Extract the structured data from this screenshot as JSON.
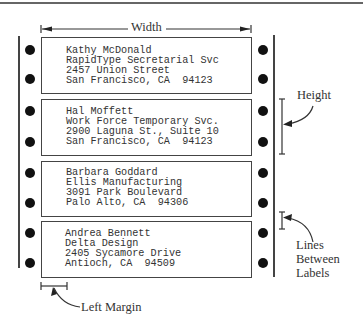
{
  "diagram": {
    "dimension_labels": {
      "width": "Width",
      "height": "Height",
      "lines_between_labels": [
        "Lines",
        "Between",
        "Labels"
      ],
      "left_margin": "Left Margin"
    },
    "labels": [
      {
        "lines": [
          "Kathy McDonald",
          "RapidType Secretarial Svc",
          "2457 Union Street",
          "San Francisco, CA  94123"
        ]
      },
      {
        "lines": [
          "Hal Moffett",
          "Work Force Temporary Svc.",
          "2900 Laguna St., Suite 10",
          "San Francisco, CA  94123"
        ]
      },
      {
        "lines": [
          "Barbara Goddard",
          "Ellis Manufacturing",
          "3091 Park Boulevard",
          "Palo Alto, CA  94306"
        ]
      },
      {
        "lines": [
          "Andrea Bennett",
          "Delta Design",
          "2405 Sycamore Drive",
          "Antioch, CA  94509"
        ]
      }
    ],
    "colors": {
      "ink": "#333333",
      "holes": "#111111",
      "background": "#ffffff"
    }
  }
}
